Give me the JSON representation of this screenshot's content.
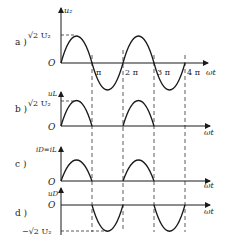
{
  "diagram": {
    "panels": [
      {
        "id": "a",
        "label": "a )",
        "ylabel": "u₂",
        "top_value": "√2 U₂",
        "origin": "O",
        "xlabel": "ωt",
        "ticks": [
          "π",
          "2 π",
          "3 π",
          "4 π"
        ]
      },
      {
        "id": "b",
        "label": "b )",
        "ylabel": "uL",
        "top_value": "√2 U₂",
        "origin": "O",
        "xlabel": "ωt"
      },
      {
        "id": "c",
        "label": "c )",
        "ylabel": "iD=iL",
        "origin": "O",
        "xlabel": "ωt"
      },
      {
        "id": "d",
        "label": "d )",
        "ylabel": "uD",
        "bottom_value": "−√2 U₂",
        "origin": "O",
        "xlabel": "ωt"
      }
    ],
    "colors": {
      "line": "#1a1a1a",
      "dash": "#333333"
    }
  }
}
